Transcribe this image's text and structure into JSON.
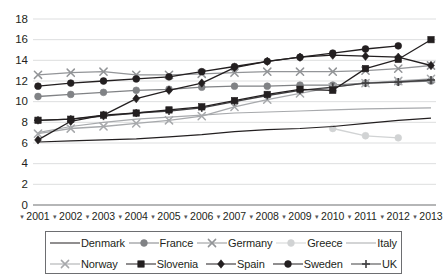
{
  "chart_data": {
    "type": "line",
    "title": "",
    "xlabel": "",
    "ylabel": "",
    "ylim": [
      0,
      18
    ],
    "ytick_step": 2,
    "yticks": [
      "0",
      "2",
      "4",
      "6",
      "8",
      "10",
      "12",
      "14",
      "16",
      "18"
    ],
    "grid": true,
    "legend_position": "bottom",
    "x_tick_prefix": "▾",
    "categories": [
      "2001",
      "2002",
      "2003",
      "2004",
      "2005",
      "2006",
      "2007",
      "2008",
      "2009",
      "2010",
      "2011",
      "2012",
      "2013"
    ],
    "series": [
      {
        "name": "Denmark",
        "color": "#231f20",
        "marker": "none",
        "values": [
          6.1,
          6.2,
          6.3,
          6.4,
          6.6,
          6.8,
          7.1,
          7.3,
          7.4,
          7.6,
          7.9,
          8.2,
          8.4
        ]
      },
      {
        "name": "France",
        "color": "#808285",
        "marker": "circle",
        "values": [
          10.5,
          10.7,
          10.9,
          11.1,
          11.2,
          11.4,
          11.5,
          11.5,
          11.6,
          11.6,
          11.8,
          11.9,
          12.0
        ]
      },
      {
        "name": "Germany",
        "color": "#939598",
        "marker": "x",
        "values": [
          12.6,
          12.8,
          12.9,
          12.6,
          12.6,
          12.7,
          12.8,
          12.9,
          12.9,
          12.9,
          13.0,
          13.2,
          13.5
        ]
      },
      {
        "name": "Greece",
        "color": "#d1d3d4",
        "marker": "circle",
        "values": [
          null,
          null,
          null,
          null,
          null,
          null,
          null,
          null,
          null,
          7.4,
          6.7,
          6.5,
          null
        ]
      },
      {
        "name": "Italy",
        "color": "#a7a9ac",
        "marker": "none",
        "values": [
          7.0,
          7.6,
          8.0,
          8.3,
          8.5,
          8.7,
          8.9,
          9.0,
          9.1,
          9.2,
          9.3,
          9.35,
          9.4
        ]
      },
      {
        "name": "Norway",
        "color": "#a7a9ac",
        "marker": "x",
        "values": [
          6.9,
          7.4,
          7.6,
          7.9,
          8.2,
          8.6,
          9.5,
          10.2,
          10.8,
          11.4,
          11.8,
          12.0,
          12.2
        ]
      },
      {
        "name": "Slovenia",
        "color": "#231f20",
        "marker": "square",
        "values": [
          8.2,
          8.3,
          8.7,
          8.9,
          9.2,
          9.5,
          10.1,
          10.7,
          11.2,
          11.1,
          13.2,
          14.1,
          16.0
        ]
      },
      {
        "name": "Spain",
        "color": "#231f20",
        "marker": "diamond",
        "values": [
          6.3,
          8.1,
          8.7,
          10.3,
          11.1,
          11.8,
          13.3,
          13.9,
          14.3,
          14.5,
          14.4,
          14.3,
          13.5
        ]
      },
      {
        "name": "Sweden",
        "color": "#231f20",
        "marker": "circle",
        "values": [
          11.5,
          11.8,
          12.0,
          12.2,
          12.4,
          12.9,
          13.4,
          13.9,
          14.3,
          14.7,
          15.1,
          15.4,
          null
        ]
      },
      {
        "name": "UK",
        "color": "#414042",
        "marker": "plus",
        "values": [
          8.2,
          8.3,
          8.6,
          8.9,
          9.1,
          9.4,
          10.0,
          10.6,
          11.1,
          11.4,
          11.8,
          11.9,
          12.1
        ]
      }
    ]
  },
  "legend": {
    "rows": [
      [
        "Denmark",
        "France",
        "Germany",
        "Greece",
        "Italy"
      ],
      [
        "Norway",
        "Slovenia",
        "Spain",
        "Sweden",
        "UK"
      ]
    ]
  }
}
